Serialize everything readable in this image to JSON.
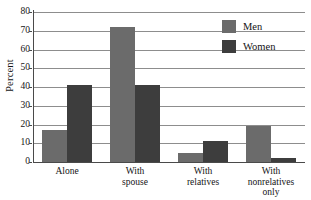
{
  "chart_data": {
    "type": "bar",
    "title": "",
    "xlabel": "",
    "ylabel": "Percent",
    "ylim": [
      0,
      80
    ],
    "yticks": [
      0,
      10,
      20,
      30,
      40,
      50,
      60,
      70,
      80
    ],
    "grid": true,
    "legend_position": "top-right",
    "categories": [
      "Alone",
      "With spouse",
      "With relatives",
      "With nonrelatives only"
    ],
    "category_lines": [
      [
        "Alone"
      ],
      [
        "With",
        "spouse"
      ],
      [
        "With",
        "relatives"
      ],
      [
        "With",
        "nonrelatives",
        "only"
      ]
    ],
    "series": [
      {
        "name": "Men",
        "color": "#6b6b6b",
        "values": [
          17,
          72,
          5,
          19
        ]
      },
      {
        "name": "Women",
        "color": "#3d3d3d",
        "values": [
          41,
          41,
          11,
          2
        ]
      }
    ]
  },
  "axis": {
    "y_title": "Percent",
    "tick_labels": [
      "80",
      "70",
      "60",
      "50",
      "40",
      "30",
      "20",
      "10",
      "0"
    ]
  },
  "legend": {
    "items": [
      {
        "label": "Men",
        "swatch": "men-swatch"
      },
      {
        "label": "Women",
        "swatch": "women-swatch"
      }
    ]
  }
}
